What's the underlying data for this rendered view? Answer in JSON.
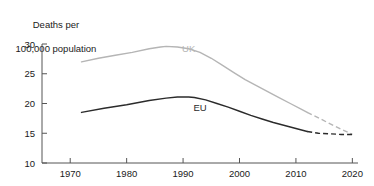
{
  "chart_data": {
    "type": "line",
    "title": "Deaths per\n100,000 population",
    "title_line1": "Deaths per",
    "title_line2": "100,000 population",
    "xlabel": "",
    "ylabel": "Deaths per 100,000 population",
    "xlim": [
      1965,
      2021
    ],
    "ylim": [
      10,
      30
    ],
    "xticks": [
      1970,
      1980,
      1990,
      2000,
      2010,
      2020
    ],
    "xtick_labels": [
      "1970",
      "1980",
      "1990",
      "2000",
      "2010",
      "2020"
    ],
    "yticks": [
      10,
      15,
      20,
      25,
      30
    ],
    "ytick_labels": [
      "10",
      "15",
      "20",
      "25",
      "30"
    ],
    "grid": false,
    "legend_position": "inline-annotation",
    "series": [
      {
        "name": "UK",
        "color": "#b5b5b5",
        "label_x": 1991,
        "label_y": 29.3,
        "solid": {
          "x": [
            1972,
            1975,
            1978,
            1981,
            1984,
            1986,
            1987,
            1989,
            1991,
            1993,
            1995,
            1997,
            1999,
            2001,
            2003,
            2005,
            2007,
            2009,
            2011,
            2012
          ],
          "y": [
            27.0,
            27.6,
            28.1,
            28.6,
            29.2,
            29.5,
            29.6,
            29.5,
            29.2,
            28.6,
            27.6,
            26.4,
            25.2,
            24.0,
            23.0,
            22.0,
            21.0,
            20.0,
            19.0,
            18.5
          ]
        },
        "dashed": {
          "x": [
            2012,
            2014,
            2016,
            2018,
            2020
          ],
          "y": [
            18.5,
            17.6,
            16.6,
            15.7,
            14.8
          ]
        }
      },
      {
        "name": "EU",
        "color": "#2b2b2b",
        "label_x": 1993,
        "label_y": 19.3,
        "solid": {
          "x": [
            1972,
            1976,
            1980,
            1984,
            1987,
            1989,
            1991,
            1992,
            1994,
            1996,
            1998,
            2000,
            2002,
            2004,
            2006,
            2008,
            2010,
            2012
          ],
          "y": [
            18.5,
            19.2,
            19.8,
            20.5,
            20.9,
            21.1,
            21.1,
            21.0,
            20.6,
            20.0,
            19.4,
            18.7,
            18.0,
            17.4,
            16.8,
            16.3,
            15.8,
            15.3
          ]
        },
        "dashed": {
          "x": [
            2012,
            2014,
            2016,
            2018,
            2020
          ],
          "y": [
            15.3,
            15.0,
            14.9,
            14.8,
            14.8
          ]
        }
      }
    ]
  },
  "axis": {
    "axis_color": "#555555",
    "tick_color": "#555555"
  }
}
